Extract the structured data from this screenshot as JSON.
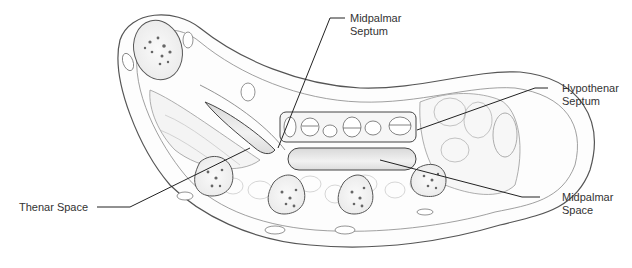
{
  "figure": {
    "labels": {
      "midpalmar_septum": [
        "Midpalmar",
        "Septum"
      ],
      "hypothenar_septum": [
        "Hypothenar",
        "Septum"
      ],
      "thenar_space": "Thenar Space",
      "midpalmar_space": [
        "Midpalmar",
        "Space"
      ]
    }
  }
}
